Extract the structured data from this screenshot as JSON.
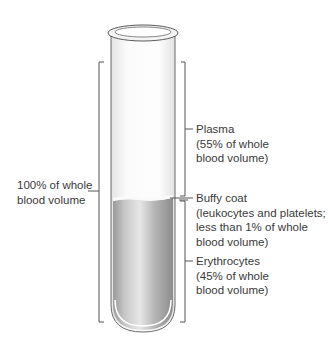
{
  "diagram": {
    "title": "",
    "whole_blood": {
      "line1": "100% of whole",
      "line2": "blood volume"
    },
    "plasma": {
      "line1": "Plasma",
      "line2": "(55% of whole",
      "line3": "blood volume)"
    },
    "buffy_coat": {
      "line1": "Buffy coat",
      "line2": "(leukocytes and platelets;",
      "line3": "less than 1% of whole",
      "line4": "blood volume)"
    },
    "erythrocytes": {
      "line1": "Erythrocytes",
      "line2": "(45% of whole",
      "line3": "blood volume)"
    },
    "colors": {
      "outline": "#5a5a5a",
      "plasma": "#f7f7f7",
      "erythrocytes_dark": "#8a8a8a",
      "erythrocytes_light": "#d8d8d8",
      "text": "#3a3a3a"
    }
  }
}
